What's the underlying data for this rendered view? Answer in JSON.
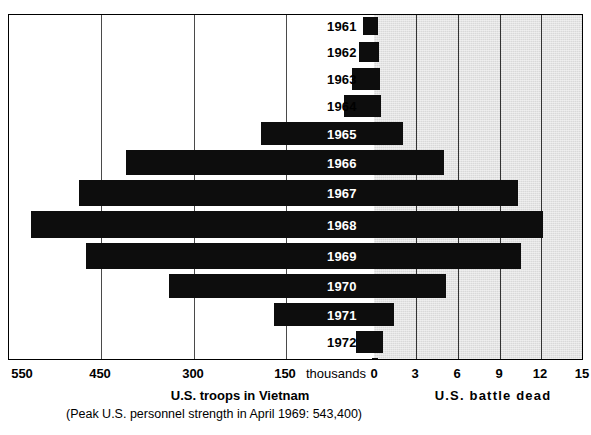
{
  "chart_data": {
    "type": "bar",
    "orientation": "horizontal-diverging",
    "title": "",
    "categories": [
      "1961",
      "1962",
      "1963",
      "1964",
      "1965",
      "1966",
      "1967",
      "1968",
      "1969",
      "1970",
      "1971",
      "1972",
      "1973"
    ],
    "series": [
      {
        "name": "U.S. troops in Vietnam",
        "unit": "thousands",
        "direction": "left",
        "axis_label": "U.S. troops in Vietnam",
        "tick_labels": [
          "550",
          "450",
          "300",
          "150"
        ],
        "tick_values": [
          550,
          450,
          300,
          150
        ],
        "values": [
          15,
          18,
          23,
          30,
          184,
          385,
          463,
          536,
          475,
          335,
          160,
          24,
          1
        ]
      },
      {
        "name": "U.S. battle dead",
        "unit": "thousands",
        "direction": "right",
        "axis_label": "U.S. battle dead",
        "tick_labels": [
          "0",
          "3",
          "6",
          "9",
          "12",
          "15"
        ],
        "tick_values": [
          0,
          3,
          6,
          9,
          12,
          15
        ],
        "values": [
          0.2,
          0.3,
          0.4,
          0.5,
          2.0,
          5.0,
          10.3,
          12.1,
          10.6,
          5.1,
          1.4,
          0.6,
          0.2
        ]
      }
    ],
    "center_unit_label": "thousands",
    "xlabel_left": "U.S. troops in Vietnam",
    "xlabel_left_note": "(Peak U.S. personnel strength in April 1969: 543,400)",
    "xlabel_right": "U.S.  battle  dead",
    "grid": true,
    "legend": "none",
    "colors": {
      "bar": "#0d0d0d",
      "shade": "#d9d9d9",
      "grid": "#4a4a4a",
      "frame": "#000000",
      "background": "#ffffff"
    }
  },
  "axis": {
    "left_ticks": [
      {
        "label": "550",
        "x": 22
      },
      {
        "label": "450",
        "x": 100
      },
      {
        "label": "300",
        "x": 193
      },
      {
        "label": "150",
        "x": 285
      }
    ],
    "center_label": {
      "label": "thousands",
      "x": 336
    },
    "right_ticks": [
      {
        "label": "0",
        "x": 374
      },
      {
        "label": "3",
        "x": 415
      },
      {
        "label": "6",
        "x": 457
      },
      {
        "label": "9",
        "x": 499
      },
      {
        "label": "12",
        "x": 540
      },
      {
        "label": "15",
        "x": 582
      }
    ]
  },
  "gridlines": {
    "left": [
      92,
      185,
      277
    ],
    "right": [
      407,
      449,
      491,
      532,
      574
    ]
  },
  "rows": [
    {
      "year": "1961",
      "top": 2,
      "height": 18,
      "bar_left": 354,
      "bar_right": 369,
      "label_x": 318,
      "label_on_bar": false
    },
    {
      "year": "1962",
      "top": 27,
      "height": 20,
      "bar_left": 350,
      "bar_right": 370,
      "label_x": 318,
      "label_on_bar": false
    },
    {
      "year": "1963",
      "top": 53,
      "height": 22,
      "bar_left": 343,
      "bar_right": 371,
      "label_x": 318,
      "label_on_bar": false
    },
    {
      "year": "1964",
      "top": 80,
      "height": 22,
      "bar_left": 335,
      "bar_right": 372,
      "label_x": 318,
      "label_on_bar": false
    },
    {
      "year": "1965",
      "top": 107,
      "height": 23,
      "bar_left": 252,
      "bar_right": 394,
      "label_x": 318,
      "label_on_bar": true
    },
    {
      "year": "1966",
      "top": 135,
      "height": 25,
      "bar_left": 117,
      "bar_right": 435,
      "label_x": 318,
      "label_on_bar": true
    },
    {
      "year": "1967",
      "top": 165,
      "height": 26,
      "bar_left": 70,
      "bar_right": 509,
      "label_x": 318,
      "label_on_bar": true
    },
    {
      "year": "1968",
      "top": 196,
      "height": 27,
      "bar_left": 22,
      "bar_right": 534,
      "label_x": 318,
      "label_on_bar": true
    },
    {
      "year": "1969",
      "top": 228,
      "height": 26,
      "bar_left": 77,
      "bar_right": 512,
      "label_x": 318,
      "label_on_bar": true
    },
    {
      "year": "1970",
      "top": 259,
      "height": 24,
      "bar_left": 160,
      "bar_right": 437,
      "label_x": 318,
      "label_on_bar": true
    },
    {
      "year": "1971",
      "top": 288,
      "height": 23,
      "bar_left": 265,
      "bar_right": 385,
      "label_x": 318,
      "label_on_bar": true
    },
    {
      "year": "1972",
      "top": 316,
      "height": 22,
      "bar_left": 347,
      "bar_right": 374,
      "label_x": 318,
      "label_on_bar": false
    },
    {
      "year": "1973",
      "top": 343,
      "height": 20,
      "bar_left": 363,
      "bar_right": 369,
      "label_x": 318,
      "label_on_bar": false
    }
  ],
  "captions": {
    "left_title": "U.S. troops in Vietnam",
    "left_note": "(Peak U.S. personnel strength in April 1969: 543,400)",
    "right_title": "U.S.  battle  dead"
  }
}
